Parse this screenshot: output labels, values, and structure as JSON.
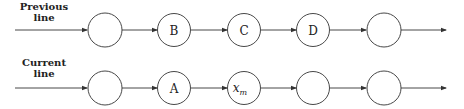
{
  "diagram": {
    "rows": [
      {
        "label_line1": "Previous",
        "label_line2": "line",
        "nodes": [
          "",
          "B",
          "C",
          "D",
          ""
        ]
      },
      {
        "label_line1": "Current",
        "label_line2": "line",
        "nodes": [
          "",
          "A",
          "x",
          "",
          ""
        ],
        "subscript": "m"
      }
    ],
    "colors": {
      "stroke": "#333333",
      "text": "#222222",
      "background": "#ffffff"
    }
  }
}
